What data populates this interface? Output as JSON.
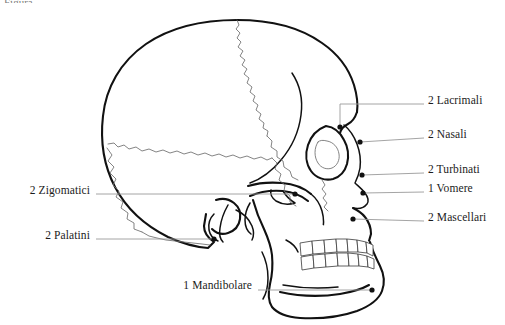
{
  "figure": {
    "title_fragment": "Figura",
    "language": "it"
  },
  "colors": {
    "background": "#ffffff",
    "outline": "#111111",
    "suture": "#6e6e6e",
    "leader": "#9a9a9a",
    "marker": "#111111",
    "text": "#1b1b1b"
  },
  "labels": {
    "right": [
      {
        "id": "lacrimali",
        "text": "2 Lacrimali",
        "x": 428,
        "y": 101,
        "dot_x": 340,
        "dot_y": 127
      },
      {
        "id": "nasali",
        "text": "2 Nasali",
        "x": 428,
        "y": 135,
        "dot_x": 360,
        "dot_y": 142
      },
      {
        "id": "turbinati",
        "text": "2 Turbinati",
        "x": 428,
        "y": 170,
        "dot_x": 362,
        "dot_y": 175
      },
      {
        "id": "vomere",
        "text": "1 Vomere",
        "x": 428,
        "y": 189,
        "dot_x": 363,
        "dot_y": 193
      },
      {
        "id": "mascellari",
        "text": "2 Mascellari",
        "x": 428,
        "y": 218,
        "dot_x": 353,
        "dot_y": 219
      }
    ],
    "left": [
      {
        "id": "zigomatici",
        "text": "2 Zigomatici",
        "x": 16,
        "y": 190,
        "dot_x": 295,
        "dot_y": 194
      },
      {
        "id": "palatini",
        "text": "2 Palatini",
        "x": 33,
        "y": 235,
        "dot_x": 214,
        "dot_y": 239
      }
    ],
    "bottom": [
      {
        "id": "mandibolare",
        "text": "1 Mandibolare",
        "x": 163,
        "y": 285,
        "dot_x": 372,
        "dot_y": 290
      }
    ]
  },
  "markers": [
    {
      "id": "lacrimali-dot",
      "x": 340,
      "y": 127
    },
    {
      "id": "nasali-dot",
      "x": 360,
      "y": 142
    },
    {
      "id": "turbinati-dot",
      "x": 362,
      "y": 175
    },
    {
      "id": "vomere-dot",
      "x": 363,
      "y": 193
    },
    {
      "id": "mascellari-dot",
      "x": 353,
      "y": 219
    },
    {
      "id": "zigomatici-dot",
      "x": 295,
      "y": 194
    },
    {
      "id": "palatini-dot",
      "x": 214,
      "y": 239
    },
    {
      "id": "mandibolare-dot",
      "x": 372,
      "y": 290
    }
  ]
}
